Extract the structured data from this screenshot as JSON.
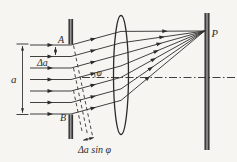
{
  "figure": {
    "type": "optics-diagram",
    "labels": {
      "slit_top_edge": "A",
      "slit_bottom_edge": "B",
      "slit_width": "a",
      "zone_width": "Δa",
      "diffraction_angle": "φ",
      "path_difference": "Δa sin φ",
      "focal_point": "P"
    },
    "colors": {
      "line": "#2b2b2b",
      "background": "#f6f5f2",
      "bar_dark": "#1f1f1f",
      "bar_light": "#b9b9b9"
    }
  }
}
